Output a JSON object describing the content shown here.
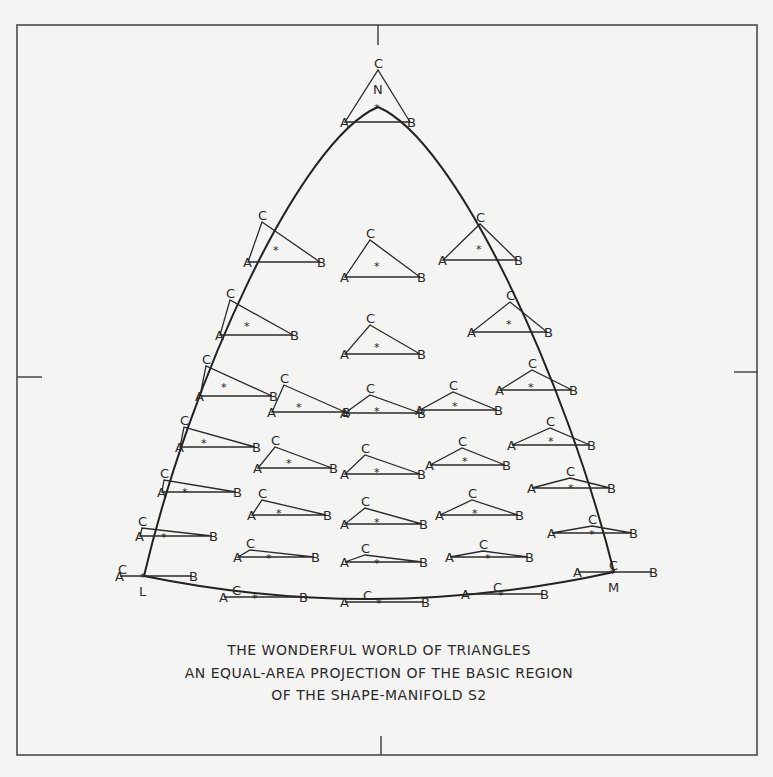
{
  "figure": {
    "caption_lines": [
      "THE WONDERFUL WORLD OF TRIANGLES",
      "AN EQUAL-AREA PROJECTION OF THE BASIC REGION",
      "OF THE SHAPE-MANIFOLD S2"
    ],
    "vertex_labels": {
      "top": "N",
      "left": "L",
      "right": "M"
    },
    "point_labels": {
      "a": "A",
      "b": "B",
      "c": "C",
      "centroid": "*"
    }
  },
  "triangles": [
    {
      "id": "N",
      "A": [
        345,
        122
      ],
      "B": [
        410,
        122
      ],
      "C": [
        378,
        70
      ],
      "star": [
        378,
        107
      ]
    },
    {
      "id": "r1a",
      "A": [
        248,
        262
      ],
      "B": [
        320,
        262
      ],
      "C": [
        262,
        222
      ],
      "star": [
        277,
        249
      ]
    },
    {
      "id": "r1b",
      "A": [
        345,
        277
      ],
      "B": [
        420,
        277
      ],
      "C": [
        370,
        240
      ],
      "star": [
        378,
        265
      ]
    },
    {
      "id": "r1c",
      "A": [
        443,
        260
      ],
      "B": [
        517,
        260
      ],
      "C": [
        480,
        224
      ],
      "star": [
        480,
        248
      ]
    },
    {
      "id": "r2a",
      "A": [
        220,
        335
      ],
      "B": [
        293,
        335
      ],
      "C": [
        230,
        300
      ],
      "star": [
        248,
        325
      ]
    },
    {
      "id": "r2b",
      "A": [
        345,
        354
      ],
      "B": [
        420,
        354
      ],
      "C": [
        370,
        325
      ],
      "star": [
        378,
        346
      ]
    },
    {
      "id": "r2c",
      "A": [
        472,
        332
      ],
      "B": [
        547,
        332
      ],
      "C": [
        510,
        302
      ],
      "star": [
        510,
        323
      ]
    },
    {
      "id": "r3a",
      "A": [
        200,
        396
      ],
      "B": [
        272,
        396
      ],
      "C": [
        206,
        366
      ],
      "star": [
        225,
        386
      ]
    },
    {
      "id": "r3b",
      "A": [
        272,
        412
      ],
      "B": [
        345,
        412
      ],
      "C": [
        284,
        385
      ],
      "star": [
        300,
        406
      ]
    },
    {
      "id": "r3c",
      "A": [
        345,
        413
      ],
      "B": [
        420,
        413
      ],
      "C": [
        370,
        395
      ],
      "star": [
        378,
        410
      ]
    },
    {
      "id": "r3d",
      "A": [
        420,
        410
      ],
      "B": [
        497,
        410
      ],
      "C": [
        453,
        392
      ],
      "star": [
        456,
        405
      ]
    },
    {
      "id": "r3e",
      "A": [
        500,
        390
      ],
      "B": [
        572,
        390
      ],
      "C": [
        532,
        370
      ],
      "star": [
        532,
        386
      ]
    },
    {
      "id": "r4a",
      "A": [
        180,
        447
      ],
      "B": [
        255,
        447
      ],
      "C": [
        184,
        427
      ],
      "star": [
        205,
        442
      ]
    },
    {
      "id": "r4b",
      "A": [
        258,
        468
      ],
      "B": [
        332,
        468
      ],
      "C": [
        275,
        447
      ],
      "star": [
        290,
        462
      ]
    },
    {
      "id": "r4c",
      "A": [
        345,
        474
      ],
      "B": [
        420,
        474
      ],
      "C": [
        365,
        455
      ],
      "star": [
        378,
        471
      ]
    },
    {
      "id": "r4d",
      "A": [
        430,
        465
      ],
      "B": [
        505,
        465
      ],
      "C": [
        462,
        448
      ],
      "star": [
        466,
        460
      ]
    },
    {
      "id": "r4e",
      "A": [
        512,
        445
      ],
      "B": [
        590,
        445
      ],
      "C": [
        550,
        428
      ],
      "star": [
        552,
        440
      ]
    },
    {
      "id": "r5a",
      "A": [
        162,
        492
      ],
      "B": [
        236,
        492
      ],
      "C": [
        164,
        480
      ],
      "star": [
        186,
        491
      ]
    },
    {
      "id": "r5b",
      "A": [
        252,
        515
      ],
      "B": [
        326,
        515
      ],
      "C": [
        262,
        500
      ],
      "star": [
        280,
        512
      ]
    },
    {
      "id": "r5c",
      "A": [
        345,
        524
      ],
      "B": [
        422,
        524
      ],
      "C": [
        365,
        508
      ],
      "star": [
        378,
        521
      ]
    },
    {
      "id": "r5d",
      "A": [
        440,
        515
      ],
      "B": [
        518,
        515
      ],
      "C": [
        472,
        500
      ],
      "star": [
        476,
        512
      ]
    },
    {
      "id": "r5e",
      "A": [
        532,
        488
      ],
      "B": [
        610,
        488
      ],
      "C": [
        570,
        478
      ],
      "star": [
        572,
        487
      ]
    },
    {
      "id": "r6a",
      "A": [
        140,
        536
      ],
      "B": [
        212,
        536
      ],
      "C": [
        142,
        528
      ],
      "star": [
        165,
        536
      ]
    },
    {
      "id": "r6b",
      "A": [
        238,
        557
      ],
      "B": [
        314,
        557
      ],
      "C": [
        250,
        550
      ],
      "star": [
        270,
        557
      ]
    },
    {
      "id": "r6c",
      "A": [
        345,
        562
      ],
      "B": [
        422,
        562
      ],
      "C": [
        365,
        555
      ],
      "star": [
        378,
        562
      ]
    },
    {
      "id": "r6d",
      "A": [
        450,
        557
      ],
      "B": [
        528,
        557
      ],
      "C": [
        483,
        551
      ],
      "star": [
        489,
        557
      ]
    },
    {
      "id": "r6e",
      "A": [
        552,
        533
      ],
      "B": [
        632,
        533
      ],
      "C": [
        592,
        526
      ],
      "star": [
        593,
        533
      ]
    },
    {
      "id": "L",
      "A": [
        120,
        576
      ],
      "B": [
        192,
        576
      ],
      "C": [
        122,
        576
      ],
      "star": [
        144,
        576
      ]
    },
    {
      "id": "M",
      "A": [
        578,
        572
      ],
      "B": [
        652,
        572
      ],
      "C": [
        613,
        572
      ],
      "star": [
        614,
        572
      ]
    },
    {
      "id": "b1",
      "A": [
        224,
        597
      ],
      "B": [
        302,
        597
      ],
      "C": [
        236,
        597
      ],
      "star": [
        256,
        597
      ]
    },
    {
      "id": "b2",
      "A": [
        345,
        602
      ],
      "B": [
        424,
        602
      ],
      "C": [
        367,
        602
      ],
      "star": [
        380,
        602
      ]
    },
    {
      "id": "b3",
      "A": [
        466,
        594
      ],
      "B": [
        543,
        594
      ],
      "C": [
        497,
        594
      ],
      "star": [
        502,
        594
      ]
    }
  ],
  "boundary": {
    "apex": [
      378,
      107
    ],
    "left": [
      144,
      576
    ],
    "right": [
      614,
      572
    ],
    "bottom": [
      378,
      600
    ]
  }
}
